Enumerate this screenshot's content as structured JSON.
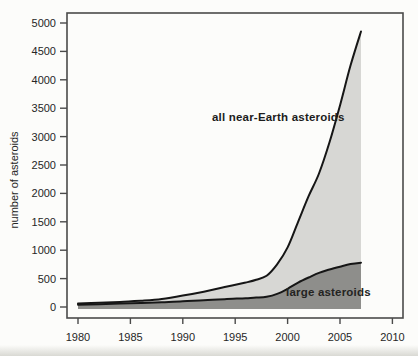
{
  "figure": {
    "y_axis_title": "number of asteroids",
    "label_all": "all near-Earth asteroids",
    "label_large": "large asteroids"
  },
  "colors": {
    "fill_all": "#d7d7d4",
    "fill_large": "#8e8e8b",
    "curve_stroke": "#161616",
    "axis_stroke": "#4a4a4a",
    "tick_text": "#262626",
    "background": "#fcfcfa"
  },
  "chart_data": {
    "type": "area",
    "title": "",
    "xlabel": "",
    "ylabel": "number of asteroids",
    "xlim": [
      1979,
      2011
    ],
    "ylim": [
      0,
      5000
    ],
    "x_ticks": [
      1980,
      1985,
      1990,
      1995,
      2000,
      2005,
      2010
    ],
    "y_ticks": [
      0,
      500,
      1000,
      1500,
      2000,
      2500,
      3000,
      3500,
      4000,
      4500,
      5000
    ],
    "grid": false,
    "legend_position": "inline-annotations",
    "x": [
      1980,
      1982,
      1984,
      1986,
      1988,
      1990,
      1992,
      1994,
      1996,
      1997,
      1998,
      1999,
      2000,
      2001,
      2002,
      2003,
      2004,
      2005,
      2006,
      2007
    ],
    "series": [
      {
        "name": "all near-Earth asteroids",
        "values": [
          60,
          75,
          90,
          110,
          140,
          200,
          270,
          350,
          430,
          480,
          550,
          750,
          1050,
          1500,
          1950,
          2350,
          2900,
          3550,
          4250,
          4850
        ]
      },
      {
        "name": "large asteroids",
        "values": [
          40,
          50,
          60,
          72,
          85,
          100,
          120,
          138,
          155,
          165,
          180,
          230,
          320,
          430,
          520,
          600,
          660,
          710,
          755,
          780
        ]
      }
    ],
    "annotations": [
      {
        "text": "all near-Earth asteroids",
        "target_series": "all near-Earth asteroids"
      },
      {
        "text": "large asteroids",
        "target_series": "large asteroids"
      }
    ]
  }
}
